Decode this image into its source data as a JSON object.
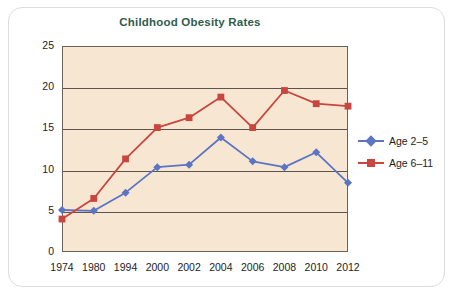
{
  "chart_data": {
    "type": "line",
    "title": "Childhood Obesity Rates",
    "xlabel": "",
    "ylabel": "Percent",
    "categories": [
      "1974",
      "1980",
      "1994",
      "2000",
      "2002",
      "2004",
      "2006",
      "2008",
      "2010",
      "2012"
    ],
    "yticks": [
      "0",
      "5",
      "10",
      "15",
      "20",
      "25"
    ],
    "ylim": [
      0,
      25
    ],
    "grid": true,
    "legend_position": "right",
    "plot_background": "#f7e7d2",
    "series": [
      {
        "name": "Age 2–5",
        "color": "#5b74c4",
        "marker": "diamond",
        "values": [
          5.1,
          5.0,
          7.2,
          10.3,
          10.6,
          13.9,
          11.0,
          10.3,
          12.1,
          8.4
        ]
      },
      {
        "name": "Age 6–11",
        "color": "#c9453f",
        "marker": "square",
        "values": [
          4.0,
          6.5,
          11.3,
          15.1,
          16.3,
          18.8,
          15.1,
          19.6,
          18.0,
          17.7
        ]
      }
    ]
  }
}
